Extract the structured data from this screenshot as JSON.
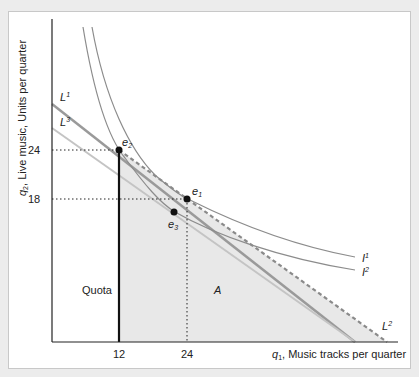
{
  "figure": {
    "y_axis_label": "Live music, Units per quarter",
    "y_axis_var": "q",
    "y_axis_sub": "2",
    "x_axis_label": ", Music tracks per quarter",
    "x_axis_var": "q",
    "x_axis_sub": "1",
    "x_ticks": [
      "12",
      "24"
    ],
    "y_ticks": [
      "24",
      "18"
    ],
    "budget_lines": [
      {
        "name": "L",
        "sup": "1",
        "style": "solid dark gray"
      },
      {
        "name": "L",
        "sup": "2",
        "style": "dashed gray"
      },
      {
        "name": "L",
        "sup": "3",
        "style": "solid light gray"
      }
    ],
    "indifference_curves": [
      {
        "name": "I",
        "sup": "1"
      },
      {
        "name": "I",
        "sup": "2"
      }
    ],
    "points": [
      {
        "name": "e",
        "sub": "1",
        "q1": 24,
        "q2": 18
      },
      {
        "name": "e",
        "sub": "2",
        "q1": 12,
        "q2": 24
      },
      {
        "name": "e",
        "sub": "3"
      }
    ],
    "regions": {
      "quota_label": "Quota",
      "area_label": "A"
    },
    "colors": {
      "shade": "#e8e8e8",
      "L1": "#9a9a9a",
      "L2": "#8a8a8a",
      "L3": "#c0c0c0",
      "curves": "#8c8c8c",
      "axis": "#222222"
    }
  }
}
